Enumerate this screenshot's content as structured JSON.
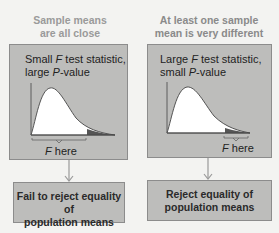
{
  "left": {
    "heading_line1": "Sample means",
    "heading_line2": "are all close",
    "panel_title_line1_pre": "Small ",
    "panel_title_var1": "F",
    "panel_title_line1_post": " test statistic,",
    "panel_title_line2_pre": "large ",
    "panel_title_var2": "P",
    "panel_title_line2_post": "-value",
    "f_label_var": "F",
    "f_label_text": " here",
    "result_line1": "Fail to reject equality of",
    "result_line2": "population means"
  },
  "right": {
    "heading_line1": "At least one sample",
    "heading_line2": "mean is very different",
    "panel_title_line1_pre": "Large ",
    "panel_title_var1": "F",
    "panel_title_line1_post": " test statistic,",
    "panel_title_line2_pre": "small ",
    "panel_title_var2": "P",
    "panel_title_line2_post": "-value",
    "f_label_var": "F",
    "f_label_text": " here",
    "result_line1": "Reject equality of",
    "result_line2": "population means"
  },
  "colors": {
    "panel_fill": "#bdbdbb",
    "curve_fill": "#ffffff",
    "tail_fill": "#555555",
    "arrow": "#9a9a9a"
  }
}
